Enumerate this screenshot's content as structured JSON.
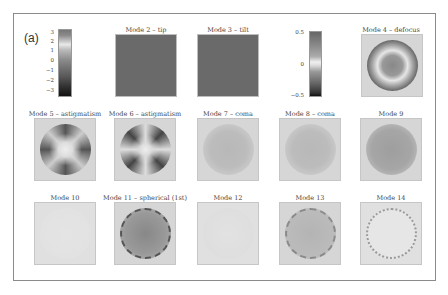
{
  "figure": {
    "panel_label": "(a)",
    "colorbar_large": {
      "ticks": [
        "3",
        "2",
        "1",
        "0",
        "−1",
        "−2",
        "−3"
      ],
      "range": [
        -3.5,
        3.5
      ]
    },
    "colorbar_small": {
      "ticks": [
        "0.5",
        "0",
        "−0.5"
      ],
      "range": [
        -0.5,
        0.5
      ]
    },
    "modes": [
      {
        "id": 2,
        "title": "Mode 2 – tip"
      },
      {
        "id": 3,
        "title": "Mode 3 – tilt"
      },
      {
        "id": 4,
        "title": "Mode 4 – defocus"
      },
      {
        "id": 5,
        "title": "Mode 5 – astigmatism"
      },
      {
        "id": 6,
        "title": "Mode 6 – astigmatism"
      },
      {
        "id": 7,
        "title": "Mode 7 – coma"
      },
      {
        "id": 8,
        "title": "Mode 8 – coma"
      },
      {
        "id": 9,
        "title": "Mode 9"
      },
      {
        "id": 10,
        "title": "Mode 10"
      },
      {
        "id": 11,
        "title": "Mode 11 – spherical (1st)"
      },
      {
        "id": 12,
        "title": "Mode 12"
      },
      {
        "id": 13,
        "title": "Mode 13"
      },
      {
        "id": 14,
        "title": "Mode 14"
      }
    ]
  }
}
